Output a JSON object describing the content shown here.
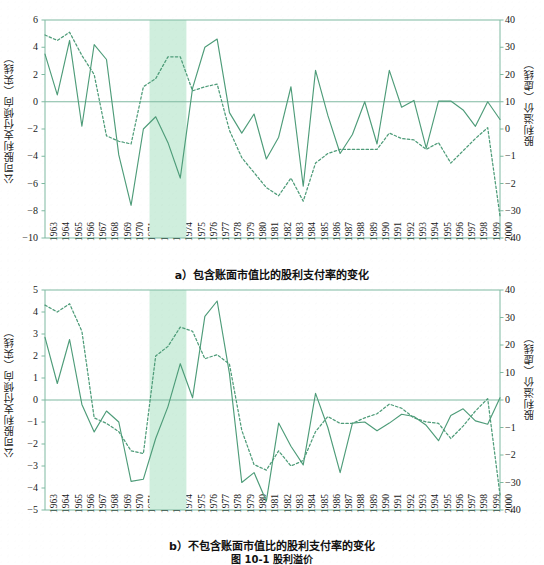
{
  "figure": {
    "caption": "图 10-1  股利溢价",
    "panels": [
      {
        "key": "a",
        "caption": "a）包含账面市值比的股利支付率的变化"
      },
      {
        "key": "b",
        "caption": "b）不包含账面市值比的股利支付率的变化"
      }
    ]
  },
  "colors": {
    "line": "#4e9c79",
    "axis": "#7fb9a1",
    "band": "#cfeedd",
    "text": "#1a1a1a",
    "background": "#ffffff"
  },
  "chart_data": [
    {
      "type": "line",
      "panel": "a",
      "title": "a）包含账面市值比的股利支付率的变化",
      "xlabel": "",
      "ylabel": "公司股利支付倾向（实线）",
      "ylabel_right": "股利溢价（虚线）",
      "grid": false,
      "legend": "encoded-in-axis-titles",
      "x": [
        1963,
        1964,
        1965,
        1966,
        1967,
        1968,
        1969,
        1970,
        1971,
        1972,
        1973,
        1974,
        1975,
        1976,
        1977,
        1978,
        1979,
        1980,
        1981,
        1982,
        1983,
        1984,
        1985,
        1986,
        1987,
        1988,
        1989,
        1990,
        1991,
        1992,
        1993,
        1994,
        1995,
        1996,
        1997,
        1998,
        1999,
        2000
      ],
      "xtick_labels": [
        "1963",
        "1964",
        "1965",
        "1966",
        "1967",
        "1968",
        "1969",
        "1970",
        "1971",
        "1972",
        "1973",
        "1974",
        "1975",
        "1976",
        "1977",
        "1978",
        "1979",
        "1980",
        "1981",
        "1982",
        "1983",
        "1984",
        "1985",
        "1986",
        "1987",
        "1988",
        "1989",
        "1990",
        "1991",
        "1992",
        "1993",
        "1994",
        "1995",
        "1996",
        "1997",
        "1998",
        "1999",
        "2000"
      ],
      "ylim": [
        -10,
        6
      ],
      "ytick_labels": [
        "6",
        "4",
        "2",
        "0",
        "-2",
        "-4",
        "-6",
        "-8",
        "-10"
      ],
      "ytick_values": [
        6,
        4,
        2,
        0,
        -2,
        -4,
        -6,
        -8,
        -10
      ],
      "ylim_right": [
        -40,
        40
      ],
      "ytick_labels_right": [
        "40",
        "30",
        "20",
        "10",
        "0",
        "-1",
        "-2",
        "-30",
        "-40"
      ],
      "ytick_values_right": [
        40,
        30,
        20,
        10,
        0,
        -10,
        -20,
        -30,
        -40
      ],
      "shaded_band": {
        "start": 1971.5,
        "end": 1974.5,
        "label": ""
      },
      "series": [
        {
          "name": "公司股利支付倾向（实线）",
          "style": "solid",
          "axis": "left",
          "values": [
            3.5,
            0.5,
            4.5,
            -1.8,
            4.2,
            3.1,
            -3.9,
            -7.6,
            -2.0,
            -1.1,
            -3.0,
            -5.6,
            1.0,
            4.0,
            4.6,
            -0.8,
            -2.3,
            -0.9,
            -4.2,
            -2.6,
            1.1,
            -6.2,
            2.3,
            -1.0,
            -3.8,
            -2.4,
            0.0,
            -3.1,
            2.3,
            -0.4,
            0.1,
            -3.4,
            0.05,
            0.05,
            -0.6,
            -1.8,
            0.0,
            -1.3
          ]
        },
        {
          "name": "股利溢价（虚线）",
          "style": "dashed",
          "axis": "right",
          "values": [
            34.5,
            32.5,
            35.5,
            27.0,
            20.0,
            -2.5,
            -4.5,
            -5.5,
            15.5,
            18.5,
            26.5,
            26.5,
            14.0,
            15.5,
            16.5,
            -0.5,
            -10.5,
            -16.0,
            -21.5,
            -24.5,
            -18.0,
            -26.5,
            -12.5,
            -9.0,
            -7.5,
            -7.5,
            -7.5,
            -7.5,
            -1.5,
            -3.5,
            -4.0,
            -7.5,
            -5.0,
            -12.5,
            -8.0,
            -3.5,
            0.5,
            -32.0
          ]
        }
      ]
    },
    {
      "type": "line",
      "panel": "b",
      "title": "b）不包含账面市值比的股利支付率的变化",
      "xlabel": "",
      "ylabel": "公司股利支付倾向（实线）",
      "ylabel_right": "股利溢价（虚线）",
      "grid": false,
      "x": [
        1963,
        1964,
        1965,
        1966,
        1967,
        1968,
        1969,
        1970,
        1971,
        1972,
        1973,
        1974,
        1975,
        1976,
        1977,
        1978,
        1979,
        1980,
        1981,
        1982,
        1983,
        1984,
        1985,
        1986,
        1987,
        1988,
        1989,
        1990,
        1991,
        1992,
        1993,
        1994,
        1995,
        1996,
        1997,
        1998,
        1999,
        2000
      ],
      "xtick_labels": [
        "1963",
        "1964",
        "1965",
        "1966",
        "1967",
        "1968",
        "1969",
        "1970",
        "1971",
        "1972",
        "1973",
        "1974",
        "1975",
        "1976",
        "1977",
        "1978",
        "1979",
        "1980",
        "1981",
        "1982",
        "1983",
        "1984",
        "1985",
        "1986",
        "1987",
        "1988",
        "1989",
        "1990",
        "1991",
        "1992",
        "1993",
        "1994",
        "1995",
        "1996",
        "1997",
        "1998",
        "1999",
        "2000"
      ],
      "ylim": [
        -5,
        5
      ],
      "ytick_labels": [
        "5",
        "4",
        "3",
        "2",
        "1",
        "0",
        "-1",
        "-2",
        "-3",
        "-4",
        "-5"
      ],
      "ytick_values": [
        5,
        4,
        3,
        2,
        1,
        0,
        -1,
        -2,
        -3,
        -4,
        -5
      ],
      "ylim_right": [
        -40,
        40
      ],
      "ytick_labels_right": [
        "40",
        "30",
        "20",
        "10",
        "0",
        "-1",
        "-2",
        "-30",
        "-40"
      ],
      "ytick_values_right": [
        40,
        30,
        20,
        10,
        0,
        -10,
        -20,
        -30,
        -40
      ],
      "shaded_band": {
        "start": 1971.5,
        "end": 1974.5,
        "label": ""
      },
      "series": [
        {
          "name": "公司股利支付倾向（实线）",
          "style": "solid",
          "axis": "left",
          "values": [
            2.85,
            0.75,
            2.75,
            -0.2,
            -1.45,
            -0.5,
            -1.0,
            -3.7,
            -3.6,
            -1.75,
            -0.3,
            1.65,
            0.1,
            3.8,
            4.5,
            1.2,
            -3.75,
            -3.3,
            -4.6,
            -1.05,
            -2.1,
            -2.95,
            0.3,
            -1.25,
            -3.3,
            -1.05,
            -1.0,
            -1.4,
            -1.05,
            -0.65,
            -0.75,
            -1.15,
            -1.85,
            -0.7,
            -0.4,
            -0.95,
            -1.1,
            0.1
          ]
        },
        {
          "name": "股利溢价（虚线）",
          "style": "dashed",
          "axis": "right",
          "values": [
            34.5,
            32.0,
            35.0,
            25.0,
            -6.5,
            -8.5,
            -11.5,
            -18.5,
            -19.5,
            16.0,
            19.5,
            26.5,
            25.0,
            15.0,
            16.5,
            13.0,
            -11.0,
            -23.5,
            -25.5,
            -18.5,
            -24.0,
            -22.0,
            -11.5,
            -6.0,
            -8.5,
            -8.5,
            -6.5,
            -5.0,
            -1.5,
            -3.0,
            -6.5,
            -8.0,
            -8.5,
            -14.0,
            -9.5,
            -4.0,
            0.5,
            -34.5
          ]
        }
      ]
    }
  ]
}
